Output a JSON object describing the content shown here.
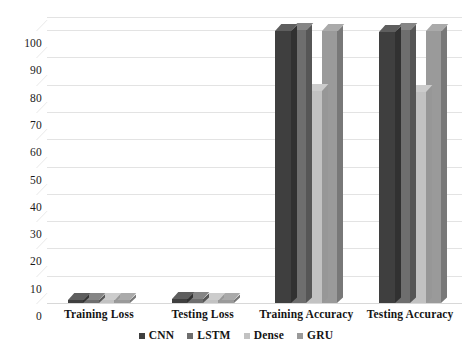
{
  "chart_data": {
    "type": "bar",
    "title": "",
    "subtitle": "",
    "xlabel": "",
    "ylabel": "",
    "categories": [
      "Training Loss",
      "Testing Loss",
      "Training Accuracy",
      "Testing Accuracy"
    ],
    "series": [
      {
        "name": "CNN",
        "color": "#3f3f3f",
        "values": [
          1.2,
          1.4,
          99.6,
          99.3
        ]
      },
      {
        "name": "LSTM",
        "color": "#6e6e6e",
        "values": [
          1.1,
          1.3,
          100.0,
          100.0
        ]
      },
      {
        "name": "Dense",
        "color": "#c2c2c2",
        "values": [
          1.0,
          1.1,
          77.5,
          77.3
        ]
      },
      {
        "name": "GRU",
        "color": "#9a9a9a",
        "values": [
          1.0,
          1.2,
          99.8,
          99.6
        ]
      }
    ],
    "ylim": [
      0,
      100
    ],
    "yticks": [
      0,
      10,
      20,
      30,
      40,
      50,
      60,
      70,
      80,
      90,
      100
    ],
    "ytick_labels": [
      "0",
      "10",
      "20",
      "30",
      "40",
      "50",
      "60",
      "70",
      "80",
      "90",
      "100"
    ],
    "grid": true,
    "grid_axis": "y",
    "legend_position": "bottom",
    "style": "3d-perspective",
    "background_color": "#ffffff",
    "grid_color": "#e3e3e3",
    "text_color": "#141414"
  },
  "legend": {
    "items": [
      {
        "label": "CNN",
        "color": "#3f3f3f"
      },
      {
        "label": "LSTM",
        "color": "#6e6e6e"
      },
      {
        "label": "Dense",
        "color": "#c2c2c2"
      },
      {
        "label": "GRU",
        "color": "#9a9a9a"
      }
    ]
  }
}
